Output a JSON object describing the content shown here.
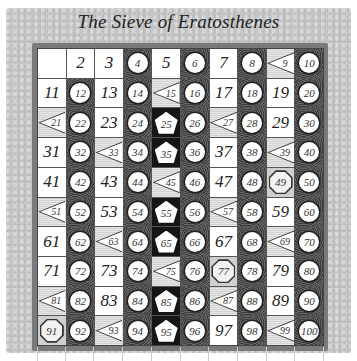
{
  "title": "The Sieve of Eratosthenes",
  "legend_scheme": {
    "plain": "1 and primes (white cell, plain number)",
    "m2": "multiples of 2 (dark stippled cell, white circle)",
    "m3": "odd multiples of 3 (light hatched cell, left-pointing triangle)",
    "m5": "multiples of 5 not divisible by 2 or 3 (black cell, white pentagon)",
    "m7": "multiples of 7 not divisible by 2, 3, or 5 (gray cell, octagon)"
  },
  "colors": {
    "plain_bg": "#ffffff",
    "m2_bg": "#3d3d3d",
    "m3_bg": "#dcdcdc",
    "m5_bg": "#151515",
    "m7_bg": "#cfcfcf",
    "frame": "#7a7a7a",
    "parchment": "#c9c9c9"
  },
  "cells": [
    {
      "n": 1,
      "label": "",
      "type": "plain"
    },
    {
      "n": 2,
      "label": "2",
      "type": "plain"
    },
    {
      "n": 3,
      "label": "3",
      "type": "plain"
    },
    {
      "n": 4,
      "label": "4",
      "type": "m2"
    },
    {
      "n": 5,
      "label": "5",
      "type": "plain"
    },
    {
      "n": 6,
      "label": "6",
      "type": "m2"
    },
    {
      "n": 7,
      "label": "7",
      "type": "plain"
    },
    {
      "n": 8,
      "label": "8",
      "type": "m2"
    },
    {
      "n": 9,
      "label": "9",
      "type": "m3"
    },
    {
      "n": 10,
      "label": "10",
      "type": "m2"
    },
    {
      "n": 11,
      "label": "11",
      "type": "plain"
    },
    {
      "n": 12,
      "label": "12",
      "type": "m2"
    },
    {
      "n": 13,
      "label": "13",
      "type": "plain"
    },
    {
      "n": 14,
      "label": "14",
      "type": "m2"
    },
    {
      "n": 15,
      "label": "15",
      "type": "m3"
    },
    {
      "n": 16,
      "label": "16",
      "type": "m2"
    },
    {
      "n": 17,
      "label": "17",
      "type": "plain"
    },
    {
      "n": 18,
      "label": "18",
      "type": "m2"
    },
    {
      "n": 19,
      "label": "19",
      "type": "plain"
    },
    {
      "n": 20,
      "label": "20",
      "type": "m2"
    },
    {
      "n": 21,
      "label": "21",
      "type": "m3"
    },
    {
      "n": 22,
      "label": "22",
      "type": "m2"
    },
    {
      "n": 23,
      "label": "23",
      "type": "plain"
    },
    {
      "n": 24,
      "label": "24",
      "type": "m2"
    },
    {
      "n": 25,
      "label": "25",
      "type": "m5"
    },
    {
      "n": 26,
      "label": "26",
      "type": "m2"
    },
    {
      "n": 27,
      "label": "27",
      "type": "m3"
    },
    {
      "n": 28,
      "label": "28",
      "type": "m2"
    },
    {
      "n": 29,
      "label": "29",
      "type": "plain"
    },
    {
      "n": 30,
      "label": "30",
      "type": "m2"
    },
    {
      "n": 31,
      "label": "31",
      "type": "plain"
    },
    {
      "n": 32,
      "label": "32",
      "type": "m2"
    },
    {
      "n": 33,
      "label": "33",
      "type": "m3"
    },
    {
      "n": 34,
      "label": "34",
      "type": "m2"
    },
    {
      "n": 35,
      "label": "35",
      "type": "m5"
    },
    {
      "n": 36,
      "label": "36",
      "type": "m2"
    },
    {
      "n": 37,
      "label": "37",
      "type": "plain"
    },
    {
      "n": 38,
      "label": "38",
      "type": "m2"
    },
    {
      "n": 39,
      "label": "39",
      "type": "m3"
    },
    {
      "n": 40,
      "label": "40",
      "type": "m2"
    },
    {
      "n": 41,
      "label": "41",
      "type": "plain"
    },
    {
      "n": 42,
      "label": "42",
      "type": "m2"
    },
    {
      "n": 43,
      "label": "43",
      "type": "plain"
    },
    {
      "n": 44,
      "label": "44",
      "type": "m2"
    },
    {
      "n": 45,
      "label": "45",
      "type": "m3"
    },
    {
      "n": 46,
      "label": "46",
      "type": "m2"
    },
    {
      "n": 47,
      "label": "47",
      "type": "plain"
    },
    {
      "n": 48,
      "label": "48",
      "type": "m2"
    },
    {
      "n": 49,
      "label": "49",
      "type": "m7"
    },
    {
      "n": 50,
      "label": "50",
      "type": "m2"
    },
    {
      "n": 51,
      "label": "51",
      "type": "m3"
    },
    {
      "n": 52,
      "label": "52",
      "type": "m2"
    },
    {
      "n": 53,
      "label": "53",
      "type": "plain"
    },
    {
      "n": 54,
      "label": "54",
      "type": "m2"
    },
    {
      "n": 55,
      "label": "55",
      "type": "m5"
    },
    {
      "n": 56,
      "label": "56",
      "type": "m2"
    },
    {
      "n": 57,
      "label": "57",
      "type": "m3"
    },
    {
      "n": 58,
      "label": "58",
      "type": "m2"
    },
    {
      "n": 59,
      "label": "59",
      "type": "plain"
    },
    {
      "n": 60,
      "label": "60",
      "type": "m2"
    },
    {
      "n": 61,
      "label": "61",
      "type": "plain"
    },
    {
      "n": 62,
      "label": "62",
      "type": "m2"
    },
    {
      "n": 63,
      "label": "63",
      "type": "m3"
    },
    {
      "n": 64,
      "label": "64",
      "type": "m2"
    },
    {
      "n": 65,
      "label": "65",
      "type": "m5"
    },
    {
      "n": 66,
      "label": "66",
      "type": "m2"
    },
    {
      "n": 67,
      "label": "67",
      "type": "plain"
    },
    {
      "n": 68,
      "label": "68",
      "type": "m2"
    },
    {
      "n": 69,
      "label": "69",
      "type": "m3"
    },
    {
      "n": 70,
      "label": "70",
      "type": "m2"
    },
    {
      "n": 71,
      "label": "71",
      "type": "plain"
    },
    {
      "n": 72,
      "label": "72",
      "type": "m2"
    },
    {
      "n": 73,
      "label": "73",
      "type": "plain"
    },
    {
      "n": 74,
      "label": "74",
      "type": "m2"
    },
    {
      "n": 75,
      "label": "75",
      "type": "m3"
    },
    {
      "n": 76,
      "label": "76",
      "type": "m2"
    },
    {
      "n": 77,
      "label": "77",
      "type": "m7"
    },
    {
      "n": 78,
      "label": "78",
      "type": "m2"
    },
    {
      "n": 79,
      "label": "79",
      "type": "plain"
    },
    {
      "n": 80,
      "label": "80",
      "type": "m2"
    },
    {
      "n": 81,
      "label": "81",
      "type": "m3"
    },
    {
      "n": 82,
      "label": "82",
      "type": "m2"
    },
    {
      "n": 83,
      "label": "83",
      "type": "plain"
    },
    {
      "n": 84,
      "label": "84",
      "type": "m2"
    },
    {
      "n": 85,
      "label": "85",
      "type": "m5"
    },
    {
      "n": 86,
      "label": "86",
      "type": "m2"
    },
    {
      "n": 87,
      "label": "87",
      "type": "m3"
    },
    {
      "n": 88,
      "label": "88",
      "type": "m2"
    },
    {
      "n": 89,
      "label": "89",
      "type": "plain"
    },
    {
      "n": 90,
      "label": "90",
      "type": "m2"
    },
    {
      "n": 91,
      "label": "91",
      "type": "m7"
    },
    {
      "n": 92,
      "label": "92",
      "type": "m2"
    },
    {
      "n": 93,
      "label": "93",
      "type": "m3"
    },
    {
      "n": 94,
      "label": "94",
      "type": "m2"
    },
    {
      "n": 95,
      "label": "95",
      "type": "m5"
    },
    {
      "n": 96,
      "label": "96",
      "type": "m2"
    },
    {
      "n": 97,
      "label": "97",
      "type": "plain"
    },
    {
      "n": 98,
      "label": "98",
      "type": "m2"
    },
    {
      "n": 99,
      "label": "99",
      "type": "m3"
    },
    {
      "n": 100,
      "label": "100",
      "type": "m2"
    }
  ]
}
